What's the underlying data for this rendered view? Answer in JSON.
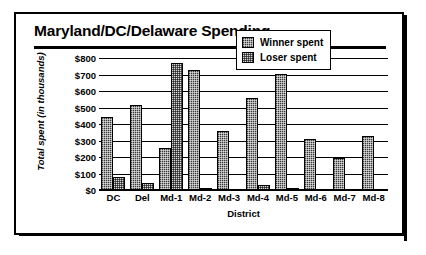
{
  "chart_data": {
    "type": "bar",
    "title": "Maryland/DC/Delaware Spending",
    "xlabel": "District",
    "ylabel": "Total spent (in thousands)",
    "categories": [
      "DC",
      "Del",
      "Md-1",
      "Md-2",
      "Md-3",
      "Md-4",
      "Md-5",
      "Md-6",
      "Md-7",
      "Md-8"
    ],
    "series": [
      {
        "name": "Winner spent",
        "color": "#3a3a3a",
        "values": [
          445,
          515,
          255,
          725,
          355,
          555,
          705,
          310,
          195,
          330
        ]
      },
      {
        "name": "Loser spent",
        "color": "#d8d8d8",
        "values": [
          80,
          45,
          770,
          8,
          5,
          30,
          8,
          5,
          5,
          5
        ]
      }
    ],
    "ylim": [
      0,
      800
    ],
    "ytick_values": [
      800,
      700,
      600,
      500,
      400,
      300,
      200,
      100,
      0
    ],
    "yticks": [
      "$800",
      "$700",
      "$600",
      "$500",
      "$400",
      "$300",
      "$200",
      "$100",
      "$0"
    ],
    "grid": true,
    "legend_position": "upper-right-inside"
  },
  "legend": {
    "entries": [
      {
        "label": "Winner spent",
        "swatch": "winner-swatch-icon"
      },
      {
        "label": "Loser spent",
        "swatch": "loser-swatch-icon"
      }
    ]
  }
}
